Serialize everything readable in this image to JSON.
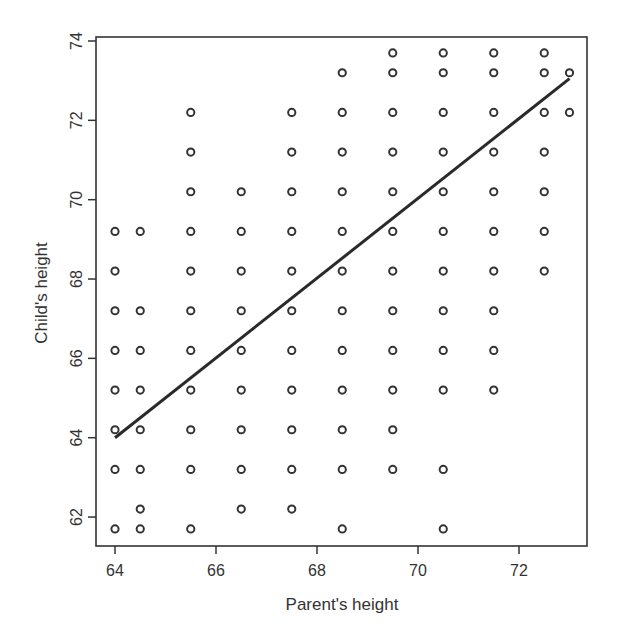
{
  "chart_data": {
    "type": "scatter",
    "title": "",
    "xlabel": "Parent's height",
    "ylabel": "Child's height",
    "xlim": [
      63.6,
      73.4
    ],
    "ylim": [
      61.3,
      74.1
    ],
    "xticks": [
      64,
      66,
      68,
      70,
      72
    ],
    "yticks": [
      62,
      64,
      66,
      68,
      70,
      72,
      74
    ],
    "grid": false,
    "legend": null,
    "marker": "open-circle",
    "series": [
      {
        "name": "observations",
        "columns": [
          {
            "x": 64.0,
            "y": [
              69.2,
              68.2,
              67.2,
              66.2,
              65.2,
              64.2,
              63.2,
              61.7
            ]
          },
          {
            "x": 64.5,
            "y": [
              69.2,
              67.2,
              66.2,
              65.2,
              64.2,
              63.2,
              62.2,
              61.7
            ]
          },
          {
            "x": 65.5,
            "y": [
              72.2,
              71.2,
              70.2,
              69.2,
              68.2,
              67.2,
              66.2,
              65.2,
              64.2,
              63.2,
              61.7
            ]
          },
          {
            "x": 66.5,
            "y": [
              70.2,
              69.2,
              68.2,
              67.2,
              66.2,
              65.2,
              64.2,
              63.2,
              62.2
            ]
          },
          {
            "x": 67.5,
            "y": [
              72.2,
              71.2,
              70.2,
              69.2,
              68.2,
              67.2,
              66.2,
              65.2,
              64.2,
              63.2,
              62.2
            ]
          },
          {
            "x": 68.5,
            "y": [
              73.2,
              72.2,
              71.2,
              70.2,
              69.2,
              68.2,
              67.2,
              66.2,
              65.2,
              64.2,
              63.2,
              61.7
            ]
          },
          {
            "x": 69.5,
            "y": [
              73.7,
              73.2,
              72.2,
              71.2,
              70.2,
              69.2,
              68.2,
              67.2,
              66.2,
              65.2,
              64.2,
              63.2
            ]
          },
          {
            "x": 70.5,
            "y": [
              73.7,
              73.2,
              72.2,
              71.2,
              70.2,
              69.2,
              68.2,
              67.2,
              66.2,
              65.2,
              63.2,
              61.7
            ]
          },
          {
            "x": 71.5,
            "y": [
              73.7,
              73.2,
              72.2,
              71.2,
              70.2,
              69.2,
              68.2,
              67.2,
              66.2,
              65.2
            ]
          },
          {
            "x": 72.5,
            "y": [
              73.7,
              73.2,
              72.2,
              71.2,
              70.2,
              69.2,
              68.2
            ]
          },
          {
            "x": 73.0,
            "y": [
              73.2,
              72.2
            ]
          }
        ]
      }
    ],
    "fit_line": {
      "name": "regression line",
      "x": [
        64.0,
        73.0
      ],
      "y": [
        64.0,
        73.05
      ]
    }
  },
  "colors": {
    "marker": "#333333",
    "line": "#2a2a2a",
    "axis": "#333333",
    "text": "#333333"
  }
}
